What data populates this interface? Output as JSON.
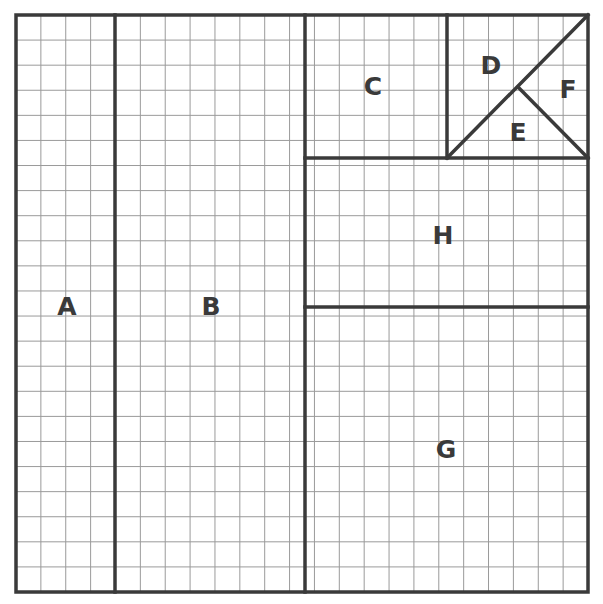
{
  "figure": {
    "type": "geometric-dissection-diagram",
    "title": "",
    "background_color": "#ffffff",
    "grid": {
      "origin_x": 16,
      "origin_y": 15,
      "columns": 23,
      "rows": 23,
      "cell_size": 24.87,
      "line_color": "#9a9a9a",
      "line_width": 1,
      "visible": true
    },
    "frame": {
      "x": 16,
      "y": 15,
      "width": 572,
      "height": 577,
      "stroke_color": "#3a3a3a",
      "stroke_width": 3.5
    },
    "divider_color": "#3a3a3a",
    "divider_width": 3.5,
    "dividers": [
      {
        "name": "a-b-divider",
        "kind": "line",
        "x1": 115,
        "y1": 15,
        "x2": 115,
        "y2": 592
      },
      {
        "name": "b-right-divider",
        "kind": "line",
        "x1": 305,
        "y1": 15,
        "x2": 305,
        "y2": 592
      },
      {
        "name": "c-h-divider",
        "kind": "line",
        "x1": 305,
        "y1": 158,
        "x2": 588,
        "y2": 158
      },
      {
        "name": "c-square-divider",
        "kind": "line",
        "x1": 447,
        "y1": 15,
        "x2": 447,
        "y2": 158
      },
      {
        "name": "def-main-diagonal",
        "kind": "line",
        "x1": 447,
        "y1": 158,
        "x2": 588,
        "y2": 15
      },
      {
        "name": "ef-diagonal",
        "kind": "line",
        "x1": 518,
        "y1": 87,
        "x2": 588,
        "y2": 158
      },
      {
        "name": "h-g-divider",
        "kind": "line",
        "x1": 305,
        "y1": 307,
        "x2": 588,
        "y2": 307
      }
    ],
    "regions": [
      {
        "id": "A",
        "label": "A",
        "label_x": 67,
        "label_y": 306,
        "shape": "rectangle",
        "x": 16,
        "y": 15,
        "width": 99,
        "height": 577,
        "grid_cells_wide": 4,
        "grid_cells_tall": 23
      },
      {
        "id": "B",
        "label": "B",
        "label_x": 211,
        "label_y": 306,
        "shape": "rectangle",
        "x": 115,
        "y": 15,
        "width": 190,
        "height": 577,
        "grid_cells_wide": 7.6,
        "grid_cells_tall": 23
      },
      {
        "id": "C",
        "label": "C",
        "label_x": 373,
        "label_y": 86,
        "shape": "rectangle",
        "x": 305,
        "y": 15,
        "width": 142,
        "height": 143,
        "grid_cells_wide": 5.7,
        "grid_cells_tall": 5.75
      },
      {
        "id": "D",
        "label": "D",
        "label_x": 491,
        "label_y": 65,
        "shape": "triangle",
        "points": "447,15 588,15 447,158"
      },
      {
        "id": "E",
        "label": "E",
        "label_x": 518,
        "label_y": 132,
        "shape": "triangle",
        "points": "447,158 518,87 588,158"
      },
      {
        "id": "F",
        "label": "F",
        "label_x": 568,
        "label_y": 89,
        "shape": "triangle",
        "points": "518,87 588,15 588,158"
      },
      {
        "id": "G",
        "label": "G",
        "label_x": 446,
        "label_y": 449,
        "shape": "rectangle",
        "x": 305,
        "y": 307,
        "width": 283,
        "height": 285,
        "grid_cells_wide": 11.4,
        "grid_cells_tall": 11.4
      },
      {
        "id": "H",
        "label": "H",
        "label_x": 443,
        "label_y": 235,
        "shape": "rectangle",
        "x": 305,
        "y": 158,
        "width": 283,
        "height": 149,
        "grid_cells_wide": 11.4,
        "grid_cells_tall": 6
      }
    ]
  }
}
